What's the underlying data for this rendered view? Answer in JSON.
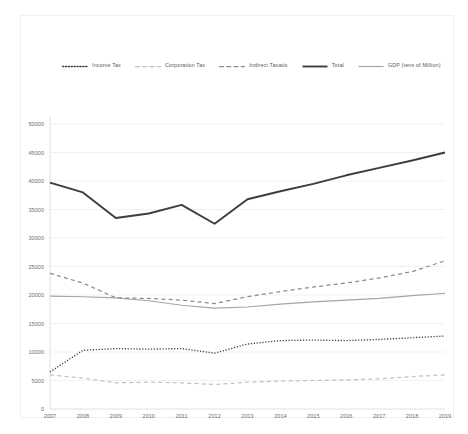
{
  "chart_data": {
    "type": "line",
    "title": "",
    "xlabel": "",
    "ylabel": "",
    "categories": [
      "2007",
      "2008",
      "2009",
      "2010",
      "2011",
      "2012",
      "2013",
      "2014",
      "2015",
      "2016",
      "2017",
      "2018",
      "2019"
    ],
    "ylim": [
      0,
      50000
    ],
    "y_ticks": [
      "0",
      "5000",
      "10000",
      "15000",
      "20000",
      "25000",
      "30000",
      "35000",
      "40000",
      "45000",
      "50000"
    ],
    "grid": true,
    "legend_position": "top",
    "series": [
      {
        "name": "Income Tax",
        "style": "dotted",
        "color": "#404040",
        "values": [
          6500,
          10300,
          10600,
          10500,
          10600,
          9800,
          11400,
          12000,
          12100,
          12000,
          12200,
          12500,
          12800
        ]
      },
      {
        "name": "Corporation Tax",
        "style": "dashed",
        "color": "#c2c2c2",
        "values": [
          6000,
          5400,
          4600,
          4700,
          4600,
          4300,
          4700,
          4900,
          5000,
          5100,
          5300,
          5700,
          6000
        ]
      },
      {
        "name": "Indirect Taxatio",
        "style": "dashed",
        "color": "#8c8c8c",
        "values": [
          23800,
          22100,
          19500,
          19400,
          19100,
          18500,
          19700,
          20600,
          21400,
          22100,
          23000,
          24100,
          26000
        ]
      },
      {
        "name": "Total",
        "style": "solid",
        "color": "#3d3d3d",
        "values": [
          39700,
          38000,
          33500,
          34300,
          35800,
          32500,
          36800,
          38200,
          39500,
          41000,
          42300,
          43600,
          45000
        ]
      },
      {
        "name": "GDP (tens of Million)",
        "style": "solid",
        "color": "#a6a6a6",
        "values": [
          19800,
          19700,
          19500,
          19000,
          18200,
          17700,
          17900,
          18400,
          18800,
          19100,
          19400,
          19900,
          20300
        ]
      }
    ]
  }
}
